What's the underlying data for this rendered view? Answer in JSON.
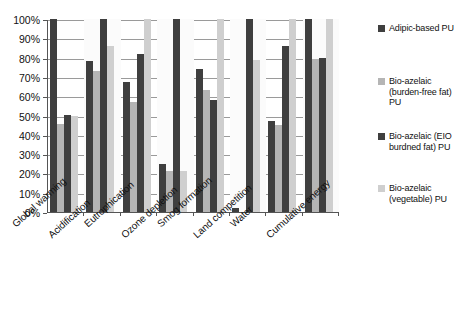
{
  "chart_data": {
    "type": "bar",
    "title": "",
    "xlabel": "",
    "ylabel": "",
    "ylim": [
      0,
      100
    ],
    "grid": true,
    "legend_position": "right",
    "categories": [
      "Global warming",
      "Acidification",
      "Eutrophication",
      "Ozone depletion",
      "Smog formation",
      "Land competition",
      "Water",
      "Cumulative energy"
    ],
    "ytick_labels": [
      "100%",
      "90%",
      "80%",
      "70%",
      "60%",
      "50%",
      "40%",
      "30%",
      "20%",
      "10%",
      "0%"
    ],
    "ytick_values": [
      100,
      90,
      80,
      70,
      60,
      50,
      40,
      30,
      20,
      10,
      0
    ],
    "series": [
      {
        "name": "Adipic-based PU",
        "color": "#3f3f3f",
        "values": [
          100,
          78.5,
          67.5,
          25,
          74,
          2,
          47,
          100
        ]
      },
      {
        "name": "Bio-azelaic (burden-free fat) PU",
        "color": "#b5b5b5",
        "values": [
          45.5,
          73,
          57,
          21,
          63,
          0,
          45,
          79.5
        ]
      },
      {
        "name": "Bio-azelaic (EIO burdned fat) PU",
        "color": "#3f3f3f",
        "values": [
          50.5,
          100,
          82,
          100,
          58,
          100,
          86,
          80
        ]
      },
      {
        "name": "Bio-azelaic (vegetable) PU",
        "color": "#cfcfcf",
        "values": [
          50,
          86,
          100,
          21,
          100,
          79,
          100,
          100
        ]
      }
    ]
  },
  "legend": {
    "items": [
      {
        "label": "Adipic-based PU",
        "color": "#3f3f3f"
      },
      {
        "label": "Bio-azelaic (burden-free fat) PU",
        "color": "#b5b5b5"
      },
      {
        "label": "Bio-azelaic (EIO burdned fat) PU",
        "color": "#3f3f3f"
      },
      {
        "label": "Bio-azelaic (vegetable) PU",
        "color": "#cfcfcf"
      }
    ]
  }
}
